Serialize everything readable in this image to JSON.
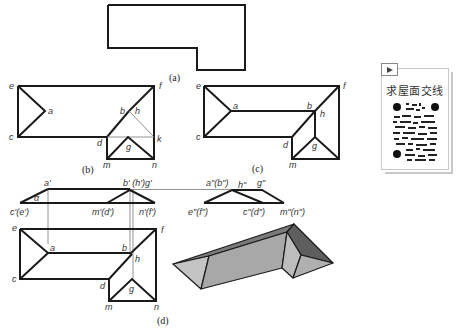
{
  "figure": {
    "captions": {
      "a": "(a)",
      "b": "(b)",
      "c": "(c)",
      "d": "(d)"
    },
    "diagram_b": {
      "labels": {
        "e": "e",
        "f": "f",
        "a": "a",
        "b": "b",
        "h": "h",
        "c": "c",
        "d": "d",
        "k": "k",
        "g": "g",
        "m": "m",
        "n": "n"
      }
    },
    "diagram_c": {
      "labels": {
        "e": "e",
        "f": "f",
        "a": "a",
        "b": "b",
        "h": "h",
        "c": "c",
        "d": "d",
        "g": "g",
        "m": "m",
        "n": "n"
      }
    },
    "diagram_d": {
      "front_view_labels": {
        "a_prime": "a'",
        "bhg_prime": "b' (h')g'",
        "alpha": "α",
        "ce_prime": "c'(e')",
        "md_prime": "m'(d')",
        "nf_prime": "n'(f')"
      },
      "side_view_labels": {
        "ab_dprime": "a\"(b\")",
        "h_dprime": "h\"",
        "g_dprime": "g\"",
        "ef_dprime": "e\"(f\")",
        "cd_dprime": "c\"(d\")",
        "mn_dprime": "m\"(n\")"
      },
      "top_view_labels": {
        "e": "e",
        "f": "f",
        "a": "a",
        "b": "b",
        "h": "h",
        "c": "c",
        "d": "d",
        "g": "g",
        "m": "m",
        "n": "n"
      }
    },
    "colors": {
      "line": "#1a1a1a",
      "projection": "#777777",
      "roof_light": "#bdbdbd",
      "roof_mid": "#a6a6a6",
      "roof_dark": "#6e6e6e"
    }
  },
  "qr_card": {
    "icon": "play-icon",
    "title": "求屋面交线"
  }
}
